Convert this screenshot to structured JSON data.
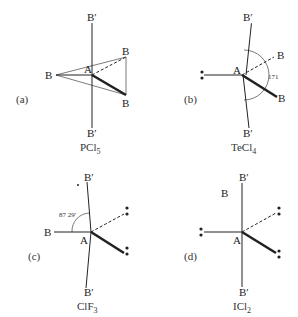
{
  "panels": [
    {
      "id": "a",
      "tag": "(a)",
      "formula_main": "PCl",
      "formula_sub": "5",
      "atoms": {
        "center": "A",
        "top": "B′",
        "bottom": "B′",
        "left": "B",
        "upper_right": "B",
        "lower_right": "B"
      }
    },
    {
      "id": "b",
      "tag": "(b)",
      "formula_main": "TeCl",
      "formula_sub": "4",
      "angle": "171",
      "atoms": {
        "center": "A",
        "top": "B′",
        "bottom": "B′",
        "upper_right": "B",
        "lower_right": "B"
      }
    },
    {
      "id": "c",
      "tag": "(c)",
      "formula_main": "ClF",
      "formula_sub": "3",
      "angle": "87 29′",
      "atoms": {
        "center": "A",
        "top": "B′",
        "bottom": "B′",
        "left": "B"
      }
    },
    {
      "id": "d",
      "tag": "(d)",
      "formula_main": "ICl",
      "formula_sub": "2",
      "atoms": {
        "center": "A",
        "top": "B′",
        "bottom": "B′",
        "left_label": "B"
      }
    }
  ]
}
